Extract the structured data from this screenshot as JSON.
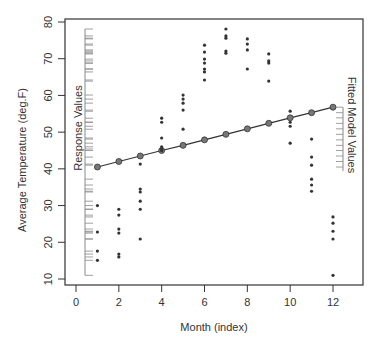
{
  "chart_data": {
    "type": "scatter",
    "title": "",
    "xlabel": "Month (index)",
    "ylabel": "Average Temperature (deg.F)",
    "xlim": [
      -0.5,
      13
    ],
    "ylim": [
      8,
      81
    ],
    "x_ticks": [
      0,
      2,
      4,
      6,
      8,
      10,
      12
    ],
    "y_ticks": [
      10,
      20,
      30,
      40,
      50,
      60,
      70,
      80
    ],
    "grid": false,
    "annotations": {
      "left_rug_label": "Response Values",
      "right_rug_label": "Fitted Model Values"
    },
    "colors": {
      "points": "#333333",
      "fitted": "#555555",
      "axis": "#333333",
      "rug": "#888888"
    },
    "series": [
      {
        "name": "Response Values",
        "kind": "points",
        "points": [
          [
            1,
            30.0
          ],
          [
            1,
            22.8
          ],
          [
            1,
            17.6
          ],
          [
            1,
            15.1
          ],
          [
            2,
            29.0
          ],
          [
            2,
            27.4
          ],
          [
            2,
            23.6
          ],
          [
            2,
            22.5
          ],
          [
            2,
            16.8
          ],
          [
            2,
            16.0
          ],
          [
            3,
            41.3
          ],
          [
            3,
            34.5
          ],
          [
            3,
            33.7
          ],
          [
            3,
            31.2
          ],
          [
            3,
            29.0
          ],
          [
            3,
            20.9
          ],
          [
            4,
            53.8
          ],
          [
            4,
            52.7
          ],
          [
            4,
            48.4
          ],
          [
            4,
            46.0
          ],
          [
            4,
            45.4
          ],
          [
            4,
            45.0
          ],
          [
            5,
            60.1
          ],
          [
            5,
            59.0
          ],
          [
            5,
            57.9
          ],
          [
            5,
            56.0
          ],
          [
            5,
            50.8
          ],
          [
            6,
            73.7
          ],
          [
            6,
            71.8
          ],
          [
            6,
            69.9
          ],
          [
            6,
            68.8
          ],
          [
            6,
            67.2
          ],
          [
            6,
            66.4
          ],
          [
            6,
            64.2
          ],
          [
            7,
            78.1
          ],
          [
            7,
            76.2
          ],
          [
            7,
            75.6
          ],
          [
            7,
            72.1
          ],
          [
            7,
            71.5
          ],
          [
            8,
            75.4
          ],
          [
            8,
            74.0
          ],
          [
            8,
            72.4
          ],
          [
            8,
            67.2
          ],
          [
            9,
            71.3
          ],
          [
            9,
            69.4
          ],
          [
            9,
            68.8
          ],
          [
            9,
            63.9
          ],
          [
            10,
            55.7
          ],
          [
            10,
            52.7
          ],
          [
            10,
            51.6
          ],
          [
            10,
            47.0
          ],
          [
            11,
            48.1
          ],
          [
            11,
            43.2
          ],
          [
            11,
            41.0
          ],
          [
            11,
            37.2
          ],
          [
            11,
            35.6
          ],
          [
            11,
            33.9
          ],
          [
            12,
            26.9
          ],
          [
            12,
            25.2
          ],
          [
            12,
            23.0
          ],
          [
            12,
            20.9
          ],
          [
            12,
            11.0
          ]
        ]
      },
      {
        "name": "Fitted Model Values",
        "kind": "line",
        "x": [
          1,
          2,
          3,
          4,
          5,
          6,
          7,
          8,
          9,
          10,
          11,
          12
        ],
        "y": [
          40.5,
          42.0,
          43.5,
          45.0,
          46.4,
          47.9,
          49.4,
          50.9,
          52.4,
          53.9,
          55.3,
          56.8
        ]
      }
    ]
  }
}
